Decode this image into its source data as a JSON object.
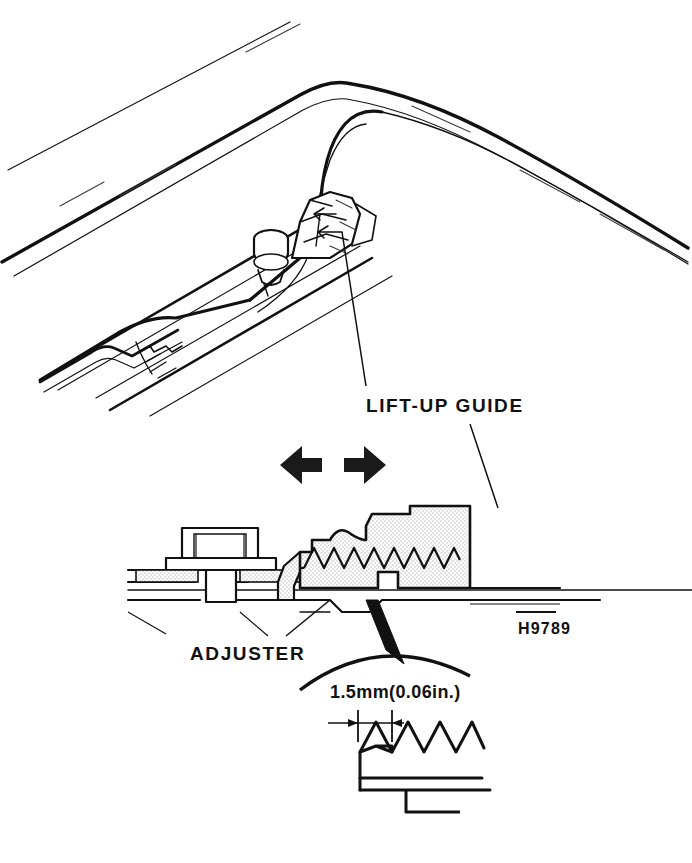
{
  "figure": {
    "kind": "technical-line-drawing",
    "background_color": "#ffffff",
    "ink_color": "#111111",
    "hatch_color": "#4a4a4a",
    "stipple_color": "#d9d9d9",
    "labels": {
      "lift_up_guide": "LIFT-UP GUIDE",
      "adjuster": "ADJUSTER",
      "dimension": "1.5mm(0.06in.)",
      "figure_code": "H9789"
    },
    "views": [
      {
        "name": "perspective-top-view",
        "description": "Roof opening edge with guide rail, bolt and lift-up guide"
      },
      {
        "name": "cross-section-view",
        "description": "Section through bolt, adjuster and serrated lift-up guide"
      },
      {
        "name": "detail-view",
        "description": "Magnified serration tooth pitch detail"
      }
    ],
    "symbols": [
      {
        "name": "bidirectional-arrow",
        "meaning": "slide adjustment direction, left and right"
      },
      {
        "name": "dimension-arrow-pair",
        "meaning": "one tooth pitch equals 1.5mm"
      }
    ]
  }
}
